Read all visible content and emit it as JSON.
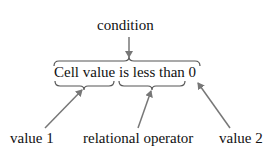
{
  "diagram": {
    "condition_label": "condition",
    "expression": "Cell value is less than 0",
    "parts": [
      {
        "label": "value 1",
        "refers_to": "Cell value"
      },
      {
        "label": "relational operator",
        "refers_to": "is less than"
      },
      {
        "label": "value 2",
        "refers_to": "0"
      }
    ],
    "colors": {
      "text": "#111111",
      "arrow": "#777777",
      "brace": "#555555"
    }
  }
}
